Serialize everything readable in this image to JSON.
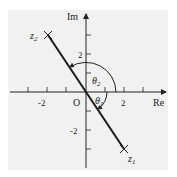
{
  "diagram": {
    "axes": {
      "x_label": "Re",
      "y_label": "Im",
      "origin_label": "O",
      "x_tick_labels": [
        "-2",
        "2"
      ],
      "y_tick_labels": [
        "2",
        "-2"
      ]
    },
    "points": [
      {
        "name": "z1",
        "label": "z",
        "sub": "1",
        "re": 2,
        "im": -3
      },
      {
        "name": "z2",
        "label": "z",
        "sub": "2",
        "re": -2,
        "im": 3
      }
    ],
    "angles": [
      {
        "name": "theta1",
        "label": "θ",
        "sub": "1",
        "direction": "clockwise"
      },
      {
        "name": "theta2",
        "label": "θ",
        "sub": "2",
        "direction": "counterclockwise"
      }
    ],
    "colors": {
      "line": "#1a1a1a",
      "background": "#f1f1f1"
    }
  }
}
